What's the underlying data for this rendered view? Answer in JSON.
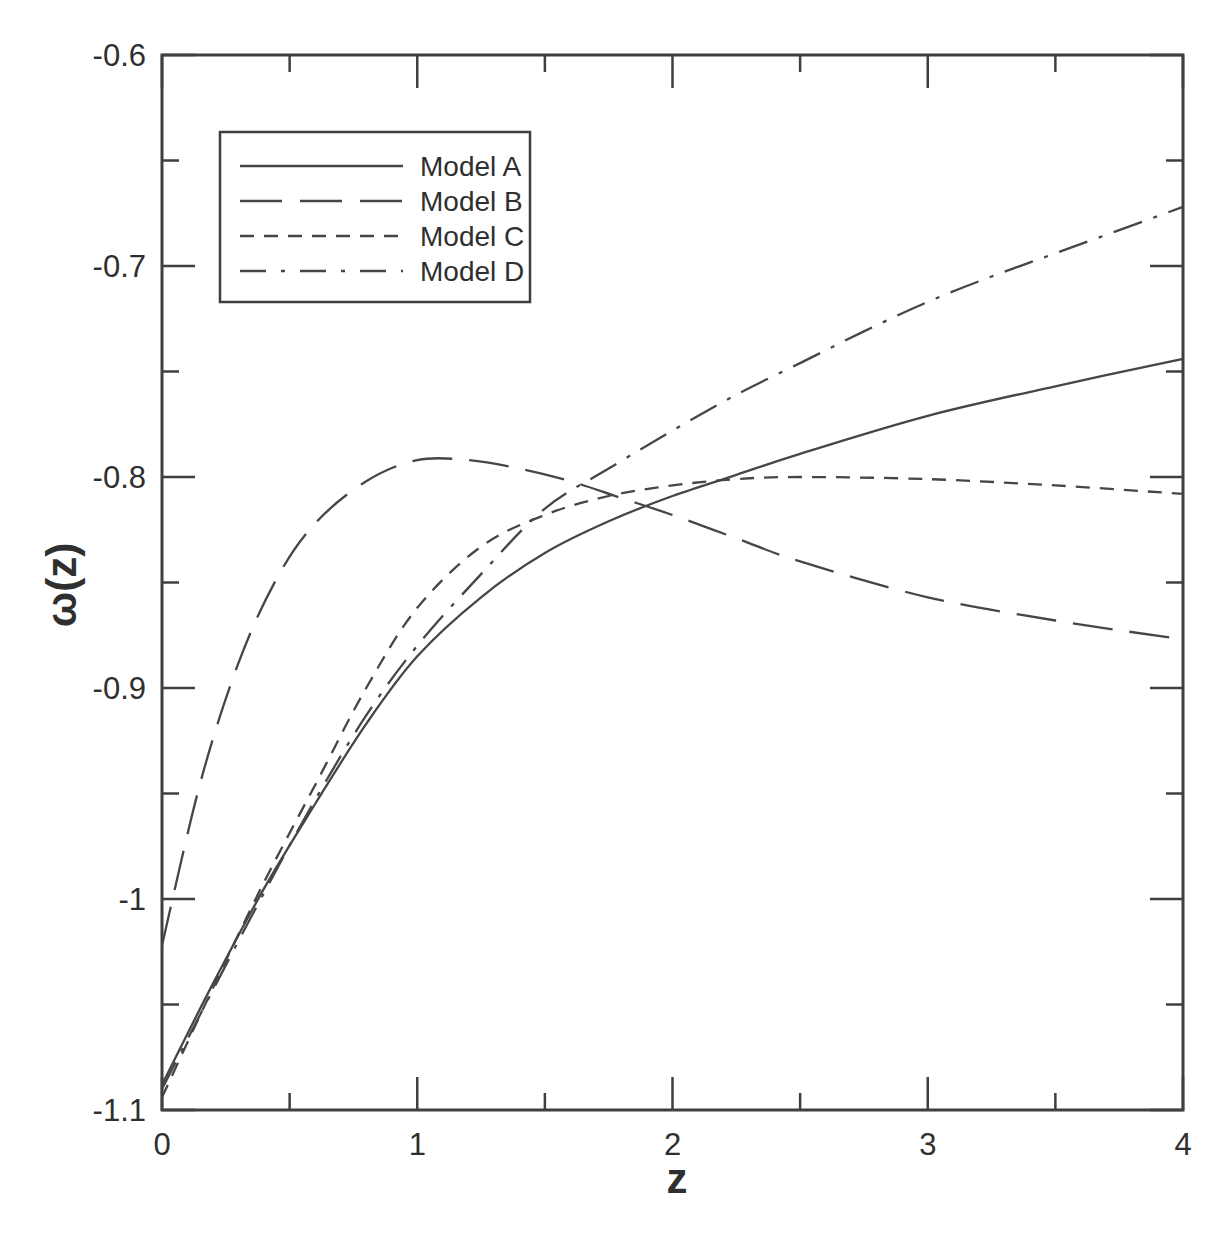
{
  "figure": {
    "background": "#ffffff",
    "ink_color": "#3f3f3f",
    "curve_color": "#464646",
    "text_color": "#2f2f2f"
  },
  "chart_data": {
    "type": "line",
    "title": "",
    "xlabel": "z",
    "ylabel": "ω(z)",
    "xlim": [
      0,
      4
    ],
    "ylim": [
      -1.1,
      -0.6
    ],
    "grid": false,
    "x_major_ticks": [
      0,
      1,
      2,
      3,
      4
    ],
    "x_minor_ticks": [
      0.5,
      1.5,
      2.5,
      3.5
    ],
    "x_tick_labels": [
      "0",
      "1",
      "2",
      "3",
      "4"
    ],
    "y_major_ticks": [
      -0.6,
      -0.7,
      -0.8,
      -0.9,
      -1,
      -1.1
    ],
    "y_minor_ticks": [
      -0.65,
      -0.75,
      -0.85,
      -0.95,
      -1.05
    ],
    "y_tick_labels": [
      "-0.6",
      "-0.7",
      "-0.8",
      "-0.9",
      "-1",
      "-1.1"
    ],
    "legend": {
      "position": "upper-left",
      "entries": [
        "Model A",
        "Model B",
        "Model C",
        "Model D"
      ]
    },
    "series": [
      {
        "name": "Model A",
        "style": "solid",
        "dash": "",
        "points": [
          [
            0,
            -1.088
          ],
          [
            0.2,
            -1.04
          ],
          [
            0.4,
            -0.995
          ],
          [
            0.6,
            -0.955
          ],
          [
            0.8,
            -0.917
          ],
          [
            1,
            -0.885
          ],
          [
            1.25,
            -0.857
          ],
          [
            1.5,
            -0.836
          ],
          [
            1.75,
            -0.821
          ],
          [
            2,
            -0.809
          ],
          [
            2.25,
            -0.799
          ],
          [
            2.5,
            -0.789
          ],
          [
            3,
            -0.771
          ],
          [
            3.5,
            -0.757
          ],
          [
            4,
            -0.744
          ]
        ]
      },
      {
        "name": "Model B",
        "style": "long-dash",
        "dash": "40 17",
        "points": [
          [
            0,
            -1.022
          ],
          [
            0.15,
            -0.945
          ],
          [
            0.3,
            -0.888
          ],
          [
            0.45,
            -0.848
          ],
          [
            0.6,
            -0.822
          ],
          [
            0.8,
            -0.802
          ],
          [
            1,
            -0.792
          ],
          [
            1.2,
            -0.792
          ],
          [
            1.4,
            -0.796
          ],
          [
            1.6,
            -0.802
          ],
          [
            1.8,
            -0.81
          ],
          [
            2,
            -0.818
          ],
          [
            2.25,
            -0.829
          ],
          [
            2.5,
            -0.84
          ],
          [
            3,
            -0.857
          ],
          [
            3.5,
            -0.868
          ],
          [
            4,
            -0.877
          ]
        ]
      },
      {
        "name": "Model C",
        "style": "short-dash",
        "dash": "14 10",
        "points": [
          [
            0,
            -1.094
          ],
          [
            0.2,
            -1.042
          ],
          [
            0.4,
            -0.992
          ],
          [
            0.6,
            -0.946
          ],
          [
            0.8,
            -0.9
          ],
          [
            1,
            -0.862
          ],
          [
            1.25,
            -0.833
          ],
          [
            1.5,
            -0.818
          ],
          [
            1.75,
            -0.809
          ],
          [
            2,
            -0.804
          ],
          [
            2.25,
            -0.801
          ],
          [
            2.5,
            -0.8
          ],
          [
            3,
            -0.801
          ],
          [
            3.5,
            -0.804
          ],
          [
            4,
            -0.808
          ]
        ]
      },
      {
        "name": "Model D",
        "style": "dash-dot",
        "dash": "30 12 4 12",
        "points": [
          [
            0,
            -1.09
          ],
          [
            0.2,
            -1.043
          ],
          [
            0.4,
            -0.997
          ],
          [
            0.6,
            -0.953
          ],
          [
            0.8,
            -0.913
          ],
          [
            1,
            -0.88
          ],
          [
            1.25,
            -0.846
          ],
          [
            1.5,
            -0.815
          ],
          [
            1.75,
            -0.796
          ],
          [
            2,
            -0.778
          ],
          [
            2.25,
            -0.761
          ],
          [
            2.5,
            -0.746
          ],
          [
            2.75,
            -0.731
          ],
          [
            3,
            -0.717
          ],
          [
            3.25,
            -0.705
          ],
          [
            3.5,
            -0.694
          ],
          [
            3.75,
            -0.683
          ],
          [
            4,
            -0.672
          ]
        ]
      }
    ]
  }
}
